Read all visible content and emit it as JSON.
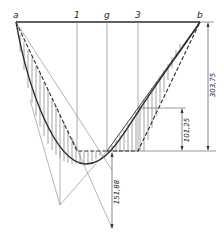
{
  "diagram": {
    "type": "influence-line / parabola construction",
    "top_labels": [
      {
        "id": "a",
        "text": "a",
        "x": 16
      },
      {
        "id": "1",
        "text": "1",
        "x": 77
      },
      {
        "id": "g",
        "text": "g",
        "x": 107
      },
      {
        "id": "3",
        "text": "3",
        "x": 138
      },
      {
        "id": "b",
        "text": "b",
        "x": 200
      }
    ],
    "dimensions": {
      "total_depth": "303,75",
      "upper_offset": "101,25",
      "lower_offset": "151,88"
    },
    "colors": {
      "line": "#2a2a2a",
      "thin": "#6a6a6a",
      "background": "#ffffff"
    }
  }
}
